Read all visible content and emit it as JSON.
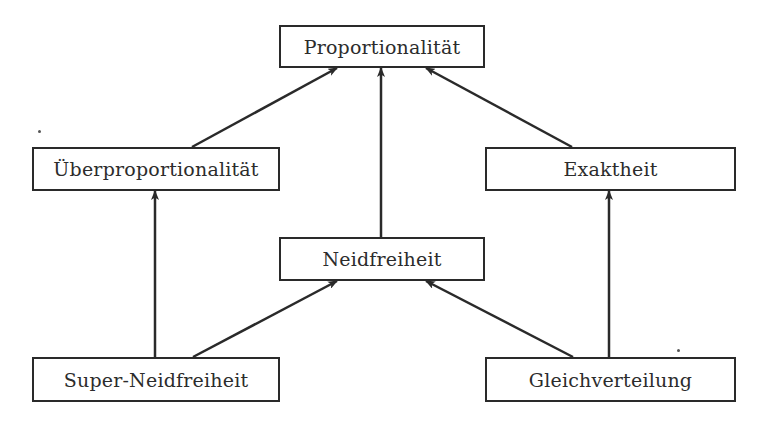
{
  "diagram": {
    "type": "hierarchy",
    "nodes": {
      "proportionalitaet": {
        "label": "Proportionalität",
        "x": 279,
        "y": 25,
        "w": 206,
        "h": 43
      },
      "ueberproportionalitaet": {
        "label": "Überproportionalität",
        "x": 32,
        "y": 147,
        "w": 248,
        "h": 44
      },
      "exaktheit": {
        "label": "Exaktheit",
        "x": 485,
        "y": 147,
        "w": 251,
        "h": 44
      },
      "neidfreiheit": {
        "label": "Neidfreiheit",
        "x": 279,
        "y": 237,
        "w": 206,
        "h": 44
      },
      "super_neidfreiheit": {
        "label": "Super-Neidfreiheit",
        "x": 32,
        "y": 357,
        "w": 248,
        "h": 45
      },
      "gleichverteilung": {
        "label": "Gleichverteilung",
        "x": 485,
        "y": 357,
        "w": 251,
        "h": 45
      }
    },
    "edges": [
      {
        "from": "ueberproportionalitaet",
        "to": "proportionalitaet",
        "x1": 192,
        "y1": 147,
        "x2": 337,
        "y2": 68
      },
      {
        "from": "neidfreiheit",
        "to": "proportionalitaet",
        "x1": 381,
        "y1": 237,
        "x2": 381,
        "y2": 68
      },
      {
        "from": "exaktheit",
        "to": "proportionalitaet",
        "x1": 572,
        "y1": 147,
        "x2": 426,
        "y2": 68
      },
      {
        "from": "super_neidfreiheit",
        "to": "ueberproportionalitaet",
        "x1": 155,
        "y1": 357,
        "x2": 155,
        "y2": 191
      },
      {
        "from": "super_neidfreiheit",
        "to": "neidfreiheit",
        "x1": 193,
        "y1": 357,
        "x2": 337,
        "y2": 281
      },
      {
        "from": "gleichverteilung",
        "to": "neidfreiheit",
        "x1": 573,
        "y1": 357,
        "x2": 426,
        "y2": 281
      },
      {
        "from": "gleichverteilung",
        "to": "exaktheit",
        "x1": 609,
        "y1": 357,
        "x2": 609,
        "y2": 191
      }
    ],
    "colors": {
      "stroke": "#2a2a2a",
      "text": "#2c2c2c",
      "background": "#ffffff"
    }
  }
}
